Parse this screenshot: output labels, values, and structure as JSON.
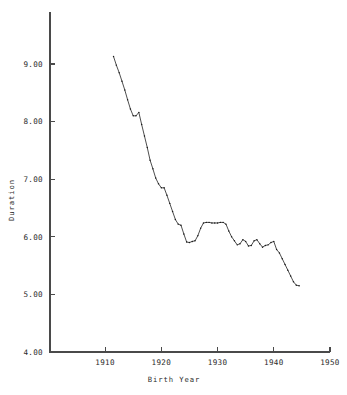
{
  "figure": {
    "background_color": "#ffffff",
    "ink_color": "#2e2e2e"
  },
  "chart_data": {
    "type": "line",
    "title": "",
    "subtitle": "",
    "xlabel": "Birth Year",
    "ylabel": "Duration",
    "xlim": [
      1900.2,
      1950
    ],
    "ylim": [
      4.0,
      9.5
    ],
    "xticks": [
      1910,
      1920,
      1930,
      1940,
      1950
    ],
    "xtick_labels": [
      "1910",
      "1920",
      "1930",
      "1940",
      "1950"
    ],
    "yticks": [
      4.0,
      5.0,
      6.0,
      7.0,
      8.0,
      9.0
    ],
    "ytick_labels": [
      "4.00",
      "5.00",
      "6.00",
      "7.00",
      "8.00",
      "9.00"
    ],
    "grid": false,
    "legend": null,
    "legend_position": "none",
    "markers": "small-dot",
    "series": [
      {
        "name": "Duration",
        "x": [
          1911.5,
          1912.0,
          1912.5,
          1913.0,
          1913.5,
          1914.0,
          1914.5,
          1915.0,
          1915.5,
          1916.0,
          1916.5,
          1917.0,
          1917.5,
          1918.0,
          1918.5,
          1919.0,
          1919.5,
          1920.0,
          1920.5,
          1921.0,
          1921.5,
          1922.0,
          1922.5,
          1923.0,
          1923.5,
          1924.0,
          1924.5,
          1925.0,
          1925.5,
          1926.0,
          1926.5,
          1927.0,
          1927.5,
          1928.0,
          1928.5,
          1929.0,
          1929.5,
          1930.0,
          1930.5,
          1931.0,
          1931.5,
          1932.0,
          1932.5,
          1933.0,
          1933.5,
          1934.0,
          1934.5,
          1935.0,
          1935.5,
          1936.0,
          1936.5,
          1937.0,
          1937.5,
          1938.0,
          1938.5,
          1939.0,
          1939.5,
          1940.0,
          1940.5,
          1941.0,
          1941.5,
          1942.0,
          1942.5,
          1943.0,
          1943.5,
          1944.0,
          1944.5
        ],
        "y": [
          9.13,
          8.98,
          8.85,
          8.7,
          8.55,
          8.38,
          8.22,
          8.1,
          8.1,
          8.16,
          7.95,
          7.75,
          7.55,
          7.33,
          7.18,
          7.02,
          6.92,
          6.85,
          6.85,
          6.72,
          6.58,
          6.44,
          6.3,
          6.22,
          6.2,
          6.05,
          5.91,
          5.9,
          5.92,
          5.93,
          6.02,
          6.15,
          6.24,
          6.25,
          6.25,
          6.24,
          6.24,
          6.24,
          6.25,
          6.25,
          6.22,
          6.1,
          6.0,
          5.93,
          5.86,
          5.88,
          5.95,
          5.92,
          5.84,
          5.85,
          5.93,
          5.95,
          5.88,
          5.82,
          5.85,
          5.86,
          5.9,
          5.92,
          5.78,
          5.72,
          5.62,
          5.52,
          5.42,
          5.32,
          5.22,
          5.16,
          5.15
        ]
      }
    ]
  },
  "accessibility": {
    "chart_description": "Line chart of Duration versus Birth Year declining from about 9.13 in 1911 to about 5.15 in 1944"
  }
}
